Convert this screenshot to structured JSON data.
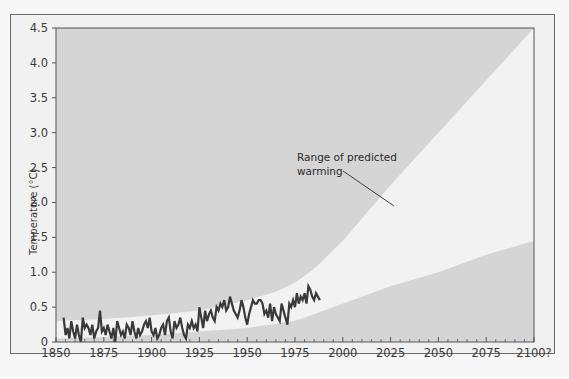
{
  "chart_data": {
    "type": "area",
    "title": "",
    "xlabel": "",
    "ylabel": "Temperature (°C)",
    "xlim": [
      1850,
      2100
    ],
    "ylim": [
      0,
      4.5
    ],
    "x_ticks": [
      "1850",
      "1875",
      "1900",
      "1925",
      "1950",
      "1975",
      "2000",
      "2025",
      "2050",
      "2075",
      "2100?"
    ],
    "y_ticks": [
      "0",
      "0.5",
      "1.0",
      "1.5",
      "2.0",
      "2.5",
      "3.0",
      "3.5",
      "4.0",
      "4.5"
    ],
    "grid": false,
    "annotations": [
      {
        "text_line1": "Range of predicted",
        "text_line2": "warming",
        "points_to": [
          2025,
          2.0
        ]
      }
    ],
    "series": [
      {
        "name": "Range of predicted warming (upper bound)",
        "type": "area-bound",
        "x": [
          1850,
          1875,
          1900,
          1925,
          1950,
          1965,
          1975,
          1985,
          2000,
          2025,
          2050,
          2075,
          2100
        ],
        "values": [
          0.3,
          0.33,
          0.38,
          0.45,
          0.6,
          0.72,
          0.85,
          1.05,
          1.45,
          2.25,
          3.0,
          3.75,
          4.5
        ]
      },
      {
        "name": "Range of predicted warming (lower bound)",
        "type": "area-bound",
        "x": [
          1850,
          1875,
          1900,
          1925,
          1950,
          1975,
          2000,
          2025,
          2050,
          2075,
          2100
        ],
        "values": [
          0.05,
          0.07,
          0.1,
          0.15,
          0.2,
          0.3,
          0.55,
          0.8,
          1.0,
          1.25,
          1.45
        ]
      },
      {
        "name": "Observed temperature",
        "type": "line",
        "x": [
          1854,
          1855,
          1856,
          1857,
          1858,
          1859,
          1860,
          1861,
          1862,
          1863,
          1864,
          1865,
          1866,
          1867,
          1868,
          1869,
          1870,
          1871,
          1872,
          1873,
          1874,
          1875,
          1876,
          1877,
          1878,
          1879,
          1880,
          1881,
          1882,
          1883,
          1884,
          1885,
          1886,
          1887,
          1888,
          1889,
          1890,
          1891,
          1892,
          1893,
          1894,
          1895,
          1896,
          1897,
          1898,
          1899,
          1900,
          1901,
          1902,
          1903,
          1904,
          1905,
          1906,
          1907,
          1908,
          1909,
          1910,
          1911,
          1912,
          1913,
          1914,
          1915,
          1916,
          1917,
          1918,
          1919,
          1920,
          1921,
          1922,
          1923,
          1924,
          1925,
          1926,
          1927,
          1928,
          1929,
          1930,
          1931,
          1932,
          1933,
          1934,
          1935,
          1936,
          1937,
          1938,
          1939,
          1940,
          1941,
          1942,
          1943,
          1944,
          1945,
          1946,
          1947,
          1948,
          1949,
          1950,
          1951,
          1952,
          1953,
          1954,
          1955,
          1956,
          1957,
          1958,
          1959,
          1960,
          1961,
          1962,
          1963,
          1964,
          1965,
          1966,
          1967,
          1968,
          1969,
          1970,
          1971,
          1972,
          1973,
          1974,
          1975,
          1976,
          1977,
          1978,
          1979,
          1980,
          1981,
          1982,
          1983,
          1984,
          1985,
          1986,
          1987,
          1988
        ],
        "values": [
          0.35,
          0.1,
          0.2,
          0.05,
          0.3,
          0.15,
          0.05,
          0.25,
          0.1,
          0.0,
          0.35,
          0.2,
          0.25,
          0.2,
          0.1,
          0.25,
          0.05,
          0.15,
          0.2,
          0.45,
          0.15,
          0.2,
          0.1,
          0.25,
          0.15,
          0.05,
          0.2,
          0.0,
          0.3,
          0.2,
          0.1,
          0.15,
          0.05,
          0.25,
          0.2,
          0.1,
          0.3,
          0.15,
          0.05,
          0.2,
          0.1,
          0.15,
          0.25,
          0.3,
          0.2,
          0.35,
          0.15,
          0.1,
          0.2,
          0.05,
          0.1,
          0.2,
          0.25,
          0.1,
          0.3,
          0.35,
          0.15,
          0.05,
          0.3,
          0.2,
          0.25,
          0.35,
          0.2,
          0.1,
          0.05,
          0.25,
          0.2,
          0.3,
          0.2,
          0.25,
          0.15,
          0.5,
          0.35,
          0.2,
          0.45,
          0.3,
          0.4,
          0.45,
          0.35,
          0.3,
          0.5,
          0.45,
          0.55,
          0.5,
          0.6,
          0.45,
          0.5,
          0.65,
          0.55,
          0.45,
          0.4,
          0.35,
          0.45,
          0.6,
          0.5,
          0.35,
          0.25,
          0.4,
          0.5,
          0.6,
          0.55,
          0.55,
          0.6,
          0.6,
          0.55,
          0.4,
          0.45,
          0.35,
          0.55,
          0.3,
          0.5,
          0.4,
          0.35,
          0.3,
          0.55,
          0.45,
          0.35,
          0.25,
          0.55,
          0.5,
          0.6,
          0.5,
          0.7,
          0.55,
          0.65,
          0.6,
          0.7,
          0.55,
          0.8,
          0.75,
          0.65,
          0.6,
          0.7,
          0.65,
          0.6
        ]
      }
    ]
  },
  "colors": {
    "outside_band": "#d5d5d5",
    "band": "#f2f2f2",
    "line": "#3a3a3a",
    "frame": "#555555"
  }
}
